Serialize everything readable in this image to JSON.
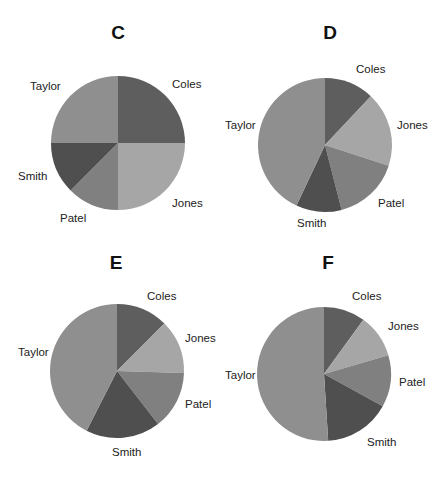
{
  "chart_data": [
    {
      "type": "pie",
      "title": "C",
      "categories": [
        "Coles",
        "Jones",
        "Patel",
        "Smith",
        "Taylor"
      ],
      "values": [
        25,
        25,
        12.5,
        12.5,
        25
      ],
      "colors": [
        "#5e5e5e",
        "#a6a6a6",
        "#808080",
        "#4f4f4f",
        "#8f8f8f"
      ],
      "start_angle": 0,
      "direction": "clockwise",
      "legend": "none",
      "labels": "outside"
    },
    {
      "type": "pie",
      "title": "D",
      "categories": [
        "Coles",
        "Jones",
        "Patel",
        "Smith",
        "Taylor"
      ],
      "values": [
        12,
        18,
        16,
        11,
        43
      ],
      "colors": [
        "#5e5e5e",
        "#a6a6a6",
        "#808080",
        "#4f4f4f",
        "#8f8f8f"
      ],
      "start_angle": 0,
      "direction": "clockwise",
      "legend": "none",
      "labels": "outside"
    },
    {
      "type": "pie",
      "title": "E",
      "categories": [
        "Coles",
        "Jones",
        "Patel",
        "Smith",
        "Taylor"
      ],
      "values": [
        12.5,
        13,
        14,
        18,
        42.5
      ],
      "colors": [
        "#5e5e5e",
        "#a6a6a6",
        "#808080",
        "#4f4f4f",
        "#8f8f8f"
      ],
      "start_angle": 0,
      "direction": "clockwise",
      "legend": "none",
      "labels": "outside"
    },
    {
      "type": "pie",
      "title": "F",
      "categories": [
        "Coles",
        "Jones",
        "Patel",
        "Smith",
        "Taylor"
      ],
      "values": [
        10,
        10.5,
        12.5,
        16,
        51
      ],
      "colors": [
        "#5e5e5e",
        "#a6a6a6",
        "#808080",
        "#4f4f4f",
        "#8f8f8f"
      ],
      "start_angle": 0,
      "direction": "clockwise",
      "legend": "none",
      "labels": "outside"
    }
  ],
  "panels": [
    {
      "title": "C",
      "labels": {
        "coles": "Coles",
        "jones": "Jones",
        "patel": "Patel",
        "smith": "Smith",
        "taylor": "Taylor"
      }
    },
    {
      "title": "D",
      "labels": {
        "coles": "Coles",
        "jones": "Jones",
        "patel": "Patel",
        "smith": "Smith",
        "taylor": "Taylor"
      }
    },
    {
      "title": "E",
      "labels": {
        "coles": "Coles",
        "jones": "Jones",
        "patel": "Patel",
        "smith": "Smith",
        "taylor": "Taylor"
      }
    },
    {
      "title": "F",
      "labels": {
        "coles": "Coles",
        "jones": "Jones",
        "patel": "Patel",
        "smith": "Smith",
        "taylor": "Taylor"
      }
    }
  ]
}
